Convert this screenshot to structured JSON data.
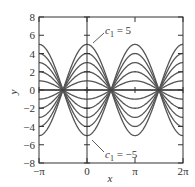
{
  "chart_data": {
    "type": "line",
    "title": "",
    "xlabel": "x",
    "ylabel": "y",
    "xlim": [
      -3.14159,
      6.28318
    ],
    "ylim": [
      -8,
      8
    ],
    "function": "y = c1 * cos(x)",
    "x_ticks": [
      {
        "value": -3.14159,
        "label": "−π"
      },
      {
        "value": 0,
        "label": "0"
      },
      {
        "value": 3.14159,
        "label": "π"
      },
      {
        "value": 6.28318,
        "label": "2π"
      }
    ],
    "y_ticks": [
      {
        "value": 8,
        "label": "8"
      },
      {
        "value": 6,
        "label": "6"
      },
      {
        "value": 4,
        "label": "4"
      },
      {
        "value": 2,
        "label": "2"
      },
      {
        "value": 0,
        "label": "0"
      },
      {
        "value": -2,
        "label": "−2"
      },
      {
        "value": -4,
        "label": "−4"
      },
      {
        "value": -6,
        "label": "−6"
      },
      {
        "value": -8,
        "label": "−8"
      }
    ],
    "series": [
      {
        "name": "c1 = -5",
        "c1": -5
      },
      {
        "name": "c1 = -4",
        "c1": -4
      },
      {
        "name": "c1 = -3",
        "c1": -3
      },
      {
        "name": "c1 = -2",
        "c1": -2
      },
      {
        "name": "c1 = -1",
        "c1": -1
      },
      {
        "name": "c1 = 0",
        "c1": 0
      },
      {
        "name": "c1 = 1",
        "c1": 1
      },
      {
        "name": "c1 = 2",
        "c1": 2
      },
      {
        "name": "c1 = 3",
        "c1": 3
      },
      {
        "name": "c1 = 4",
        "c1": 4
      },
      {
        "name": "c1 = 5",
        "c1": 5
      }
    ],
    "annotations": [
      {
        "text_var": "c",
        "text_sub": "1",
        "text_rest": " = 5",
        "points_to": {
          "x": 0.35,
          "y": 5
        }
      },
      {
        "text_var": "c",
        "text_sub": "1",
        "text_rest": " = −5",
        "points_to": {
          "x": 0.35,
          "y": -5
        }
      }
    ],
    "grid": false,
    "legend": "none",
    "colors": {
      "curve": "#555555",
      "axis": "#333333",
      "frame": "#333333"
    }
  }
}
